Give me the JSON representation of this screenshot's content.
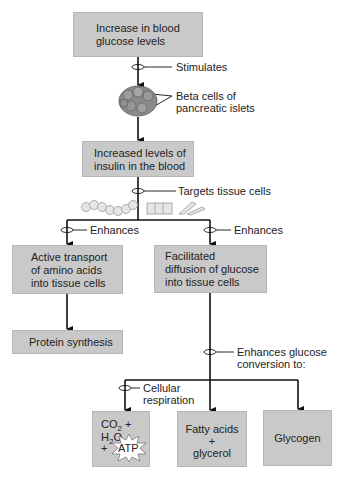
{
  "diagram": {
    "boxes": {
      "glucose": {
        "line1": "Increase in blood",
        "line2": "glucose levels"
      },
      "insulin": {
        "line1": "Increased levels of",
        "line2": "insulin in the blood"
      },
      "amino": {
        "line1": "Active transport",
        "line2": "of amino acids",
        "line3": "into tissue cells"
      },
      "diffusion": {
        "line1": "Facilitated",
        "line2": "diffusion of glucose",
        "line3": "into tissue cells"
      },
      "protein": {
        "label": "Protein synthesis"
      },
      "co2": {
        "co": "CO",
        "sub2": "2",
        "plus_h": " + H",
        "sub2b": "2",
        "o": "O",
        "plus": "+",
        "atp": "ATP"
      },
      "fatty": {
        "line1": "Fatty acids",
        "line2": "+",
        "line3": "glycerol"
      },
      "glycogen": {
        "label": "Glycogen"
      }
    },
    "labels": {
      "stimulates": "Stimulates",
      "beta1": "Beta cells of",
      "beta2": "pancreatic islets",
      "targets": "Targets tissue cells",
      "enhances_left": "Enhances",
      "enhances_right": "Enhances",
      "conv1": "Enhances glucose",
      "conv2": "conversion to:",
      "resp1": "Cellular",
      "resp2": "respiration"
    },
    "colors": {
      "box": "#c9c9c9",
      "line": "#111111",
      "cell": "#8a8a8a"
    }
  }
}
